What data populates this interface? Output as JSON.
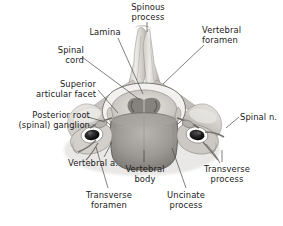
{
  "figure": {
    "name": "cervical-vertebra-superior-view",
    "background_color": "#ffffff",
    "width": 283,
    "height": 226,
    "leader_color": "#4a4a4a",
    "text_color": "#1a1a1a"
  },
  "labels": {
    "spinous_process": "Spinous\nprocess",
    "vertebral_foramen": "Vertebral\nforamen",
    "lamina": "Lamina",
    "spinal_cord": "Spinal\ncord",
    "superior_articular_facet": "Superior\narticular facet",
    "posterior_root_ganglion": "Posterior root\n(spinal) ganglion",
    "spinal_n": "Spinal n.",
    "vertebral_a": "Vertebral a.",
    "transverse_foramen": "Transverse\nforamen",
    "vertebral_body": "Vertebral\nbody",
    "uncinate_process": "Uncinate\nprocess",
    "transverse_process": "Transverse\nprocess"
  },
  "anatomy": {
    "bone_light": "#e9e7e4",
    "bone_mid": "#c9c6c1",
    "bone_dark": "#9c9893",
    "bone_shadow": "#6f6c68",
    "cord_light": "#d8d6d2",
    "cord_grey": "#8e8b86",
    "foramen_dark": "#151515",
    "artery_ring": "#ffffff",
    "disc_mid": "#8d8a85"
  }
}
